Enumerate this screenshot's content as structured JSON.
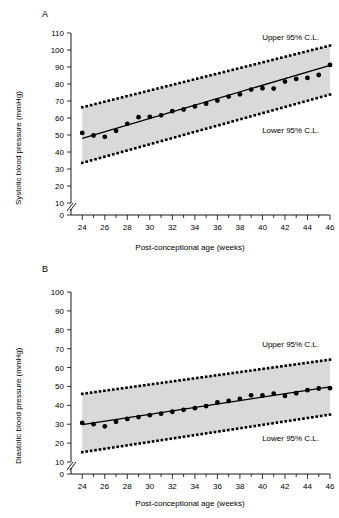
{
  "figure": {
    "panel_a_letter": "A",
    "panel_b_letter": "B"
  },
  "chart_data": [
    {
      "type": "scatter",
      "panel": "A",
      "title": "",
      "xlabel": "Post-conceptional age (weeks)",
      "ylabel": "Systolic blood pressure (mmHg)",
      "xlim": [
        23,
        46
      ],
      "ylim": [
        0,
        110
      ],
      "xticks": [
        24,
        26,
        28,
        30,
        32,
        34,
        36,
        38,
        40,
        42,
        44,
        46
      ],
      "xminorticks": [
        25,
        27,
        29,
        31,
        33,
        35,
        37,
        39,
        41,
        43,
        45
      ],
      "yticks": [
        0,
        10,
        20,
        30,
        40,
        50,
        60,
        70,
        80,
        90,
        100,
        110
      ],
      "axis_break": true,
      "grid": false,
      "legend": "none",
      "annotations": [
        {
          "text": "Upper 95% C.L.",
          "x": 42.5,
          "y": 106
        },
        {
          "text": "Lower 95% C.L.",
          "x": 42.5,
          "y": 51
        }
      ],
      "x": [
        24,
        25,
        26,
        27,
        28,
        29,
        30,
        31,
        32,
        33,
        34,
        35,
        36,
        37,
        38,
        39,
        40,
        41,
        42,
        43,
        44,
        45,
        46
      ],
      "values": [
        51.2,
        49.7,
        48.9,
        52.5,
        56.6,
        60.5,
        60.7,
        61.6,
        64.0,
        65.0,
        66.8,
        68.4,
        70.3,
        72.6,
        73.9,
        76.7,
        77.5,
        77.3,
        81.4,
        83.0,
        83.6,
        85.3,
        91.2
      ],
      "series": [
        {
          "name": "Regression line",
          "style": "solid-line",
          "x": [
            24,
            46
          ],
          "values": [
            48.0,
            91.0
          ]
        },
        {
          "name": "Upper 95% C.L.",
          "style": "dotted-line",
          "x": [
            24,
            46
          ],
          "values": [
            66.3,
            102.6
          ]
        },
        {
          "name": "Lower 95% C.L.",
          "style": "dotted-line",
          "x": [
            24,
            46
          ],
          "values": [
            33.6,
            73.8
          ]
        }
      ],
      "band_fill": "#d9d9d9"
    },
    {
      "type": "scatter",
      "panel": "B",
      "title": "",
      "xlabel": "Post-conceptional age (weeks)",
      "ylabel": "Diastolic blood pressure (mmHg)",
      "xlim": [
        23,
        46
      ],
      "ylim": [
        0,
        100
      ],
      "xticks": [
        24,
        26,
        28,
        30,
        32,
        34,
        36,
        38,
        40,
        42,
        44,
        46
      ],
      "xminorticks": [
        25,
        27,
        29,
        31,
        33,
        35,
        37,
        39,
        41,
        43,
        45
      ],
      "yticks": [
        0,
        10,
        20,
        30,
        40,
        50,
        60,
        70,
        80,
        90,
        100
      ],
      "axis_break": true,
      "grid": false,
      "legend": "none",
      "annotations": [
        {
          "text": "Upper 95% C.L.",
          "x": 42.5,
          "y": 71
        },
        {
          "text": "Lower 95% C.L.",
          "x": 42.5,
          "y": 21
        }
      ],
      "x": [
        24,
        25,
        26,
        27,
        28,
        29,
        30,
        31,
        32,
        33,
        34,
        35,
        36,
        37,
        38,
        39,
        40,
        41,
        42,
        43,
        44,
        45,
        46
      ],
      "values": [
        30.7,
        30.0,
        28.9,
        31.3,
        32.8,
        33.8,
        34.8,
        35.6,
        36.6,
        37.6,
        38.5,
        39.6,
        41.5,
        42.3,
        43.4,
        45.3,
        45.2,
        46.2,
        45.0,
        46.4,
        48.0,
        48.9,
        49.1
      ],
      "series": [
        {
          "name": "Regression line",
          "style": "solid-line",
          "x": [
            24,
            46
          ],
          "values": [
            29.8,
            49.8
          ]
        },
        {
          "name": "Upper 95% C.L.",
          "style": "dotted-line",
          "x": [
            24,
            46
          ],
          "values": [
            46.1,
            64.2
          ]
        },
        {
          "name": "Lower 95% C.L.",
          "style": "dotted-line",
          "x": [
            24,
            46
          ],
          "values": [
            15.2,
            35.1
          ]
        }
      ],
      "band_fill": "#d9d9d9"
    }
  ]
}
